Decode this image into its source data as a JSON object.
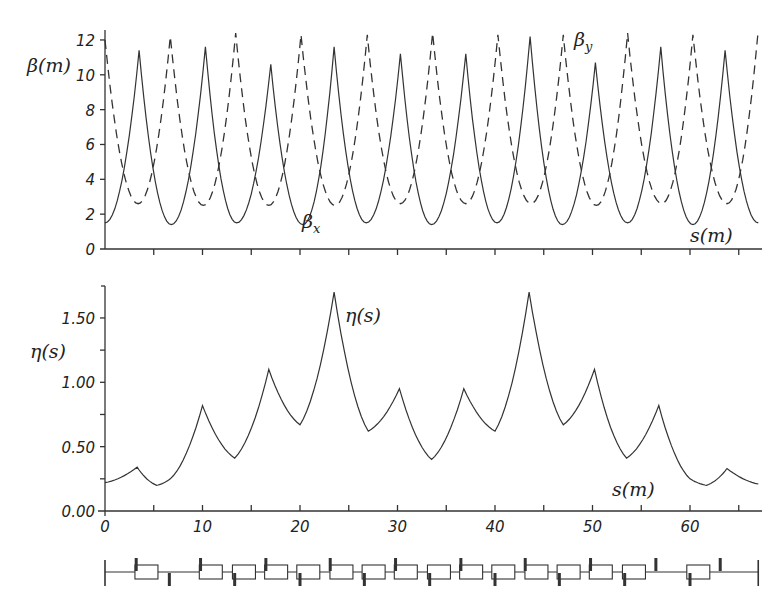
{
  "chart_data": [
    {
      "type": "line",
      "title": "",
      "xlabel": "s(m)",
      "ylabel": "β(m)",
      "xlim": [
        0,
        67
      ],
      "ylim": [
        0,
        12.5
      ],
      "yticks": [
        0,
        2,
        4,
        6,
        8,
        10,
        12
      ],
      "ytick_labels": [
        "0",
        "2",
        "4",
        "6",
        "8",
        "10",
        "12"
      ],
      "xticks": [
        0,
        5,
        10,
        15,
        20,
        25,
        30,
        35,
        40,
        45,
        50,
        55,
        60,
        65
      ],
      "grid": false,
      "series": [
        {
          "name": "β_x",
          "style": "solid",
          "peaks_s": [
            3.5,
            10.3,
            17.0,
            23.5,
            30.3,
            37.0,
            43.6,
            50.3,
            57.0,
            63.6
          ],
          "peaks_beta": [
            11.4,
            11.6,
            10.6,
            11.6,
            11.2,
            11.2,
            12.2,
            10.7,
            11.6,
            11.4
          ],
          "minima_s": [
            0,
            6.8,
            13.5,
            20.3,
            26.8,
            33.5,
            40.2,
            46.9,
            53.6,
            60.3,
            67
          ],
          "minima_beta": [
            1.5,
            1.4,
            1.5,
            1.4,
            1.5,
            1.4,
            1.5,
            1.4,
            1.5,
            1.4,
            1.5
          ]
        },
        {
          "name": "β_y",
          "style": "dashed",
          "peaks_s": [
            0,
            6.7,
            13.4,
            20.1,
            26.9,
            33.6,
            40.3,
            47.0,
            53.6,
            60.3,
            67
          ],
          "peaks_beta": [
            12.0,
            12.2,
            12.4,
            12.3,
            12.3,
            12.4,
            12.3,
            12.3,
            12.4,
            12.3,
            12.6
          ],
          "minima_s": [
            3.4,
            10.1,
            16.8,
            23.6,
            30.3,
            37.0,
            43.7,
            50.4,
            57.1,
            63.8
          ],
          "minima_beta": [
            2.6,
            2.5,
            2.5,
            2.5,
            2.6,
            2.6,
            2.6,
            2.5,
            2.6,
            2.6
          ]
        }
      ],
      "annotations": [
        "β_x",
        "β_y",
        "s(m)"
      ]
    },
    {
      "type": "line",
      "title": "",
      "xlabel": "s(m)",
      "ylabel": "η(s)",
      "xlim": [
        0,
        67
      ],
      "ylim": [
        0,
        1.75
      ],
      "yticks": [
        0.0,
        0.25,
        0.5,
        0.75,
        1.0,
        1.25,
        1.5
      ],
      "ytick_labels": [
        "0.00",
        "",
        "0.50",
        "",
        "1.00",
        "",
        "1.50"
      ],
      "xticks": [
        0,
        5,
        10,
        15,
        20,
        25,
        30,
        35,
        40,
        45,
        50,
        55,
        60,
        65
      ],
      "xtick_labels": [
        "0",
        "",
        "10",
        "",
        "20",
        "",
        "30",
        "",
        "40",
        "",
        "50",
        "",
        "60",
        ""
      ],
      "grid": false,
      "series": [
        {
          "name": "η(s)",
          "x": [
            0,
            3.3,
            5.3,
            6.7,
            10.0,
            13.3,
            16.8,
            20.0,
            23.5,
            27.0,
            30.2,
            33.5,
            36.8,
            40.0,
            43.5,
            47.0,
            50.2,
            53.5,
            56.8,
            60.0,
            61.7,
            63.8,
            67.0
          ],
          "y": [
            0.22,
            0.34,
            0.2,
            0.25,
            0.82,
            0.41,
            1.1,
            0.67,
            1.7,
            0.62,
            0.95,
            0.4,
            0.95,
            0.62,
            1.7,
            0.67,
            1.1,
            0.41,
            0.82,
            0.25,
            0.2,
            0.33,
            0.21
          ]
        }
      ],
      "annotations": [
        "η(s)",
        "s(m)"
      ]
    }
  ],
  "top": {
    "ylabel": "β(m)",
    "yticks": [
      "0",
      "2",
      "4",
      "6",
      "8",
      "10",
      "12"
    ],
    "label_bx": "β",
    "label_bx_sub": "x",
    "label_by": "β",
    "label_by_sub": "y",
    "xlabel": "s(m)"
  },
  "bottom": {
    "ylabel": "η(s)",
    "yticks": [
      "0.00",
      "0.50",
      "1.00",
      "1.50"
    ],
    "xticks": [
      "0",
      "10",
      "20",
      "30",
      "40",
      "50",
      "60"
    ],
    "curve_label": "η(s)",
    "xlabel": "s(m)"
  },
  "lattice": {
    "description": "magnet lattice layout: dipoles (boxes) and quadrupoles (bars above/below)"
  }
}
